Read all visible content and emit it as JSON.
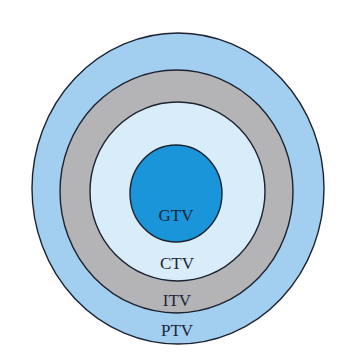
{
  "diagram": {
    "type": "nested-target-volumes",
    "layers": [
      {
        "id": "ptv",
        "label": "PTV",
        "fill": "#a2cff0",
        "stroke": "#1c2230"
      },
      {
        "id": "itv",
        "label": "ITV",
        "fill": "#b4b4b6",
        "stroke": "#1c2230"
      },
      {
        "id": "ctv",
        "label": "CTV",
        "fill": "#d8edf9",
        "stroke": "#1c2230"
      },
      {
        "id": "gtv",
        "label": "GTV",
        "fill": "#1a95d9",
        "stroke": "#1c2230"
      }
    ]
  }
}
